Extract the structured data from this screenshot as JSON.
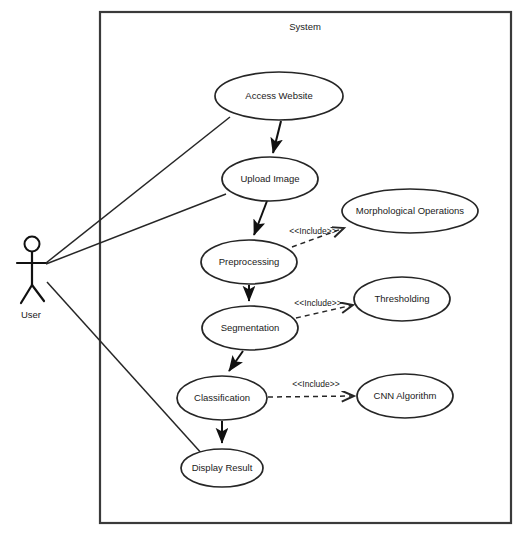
{
  "diagram": {
    "kind": "uml-use-case-diagram",
    "boundary": {
      "label": "System",
      "x": 100,
      "y": 12,
      "width": 411,
      "height": 511
    },
    "actors": [
      {
        "id": "user",
        "label": "User",
        "x": 32,
        "y": 244
      }
    ],
    "use_cases": [
      {
        "id": "access_website",
        "label": "Access Website",
        "cx": 279,
        "cy": 96,
        "rx": 64,
        "ry": 24
      },
      {
        "id": "upload_image",
        "label": "Upload Image",
        "cx": 270,
        "cy": 179,
        "rx": 48,
        "ry": 22
      },
      {
        "id": "preprocessing",
        "label": "Preprocessing",
        "cx": 249,
        "cy": 262,
        "rx": 48,
        "ry": 22
      },
      {
        "id": "segmentation",
        "label": "Segmentation",
        "cx": 250,
        "cy": 328,
        "rx": 48,
        "ry": 22
      },
      {
        "id": "classification",
        "label": "Classification",
        "cx": 222,
        "cy": 398,
        "rx": 45,
        "ry": 22
      },
      {
        "id": "display_result",
        "label": "Display Result",
        "cx": 222,
        "cy": 468,
        "rx": 41,
        "ry": 19
      },
      {
        "id": "morphological_operations",
        "label": "Morphological Operations",
        "cx": 410,
        "cy": 211,
        "rx": 68,
        "ry": 22
      },
      {
        "id": "thresholding",
        "label": "Thresholding",
        "cx": 402,
        "cy": 299,
        "rx": 48,
        "ry": 22
      },
      {
        "id": "cnn_algorithm",
        "label": "CNN Algorithm",
        "cx": 405,
        "cy": 396,
        "rx": 48,
        "ry": 22
      }
    ],
    "associations": [
      {
        "id": "user-access-website",
        "from": "user",
        "to": "access_website"
      },
      {
        "id": "user-upload-image",
        "from": "user",
        "to": "upload_image"
      },
      {
        "id": "user-display-result",
        "from": "user",
        "to": "display_result"
      }
    ],
    "flows": [
      {
        "id": "access-website-to-upload-image",
        "from": "access_website",
        "to": "upload_image"
      },
      {
        "id": "upload-image-to-preprocessing",
        "from": "upload_image",
        "to": "preprocessing"
      },
      {
        "id": "preprocessing-to-segmentation",
        "from": "preprocessing",
        "to": "segmentation"
      },
      {
        "id": "segmentation-to-classification",
        "from": "segmentation",
        "to": "classification"
      },
      {
        "id": "classification-to-display-result",
        "from": "classification",
        "to": "display_result"
      }
    ],
    "includes": [
      {
        "id": "preprocessing-includes-morphological",
        "from": "preprocessing",
        "to": "morphological_operations",
        "label": "<<Include>>"
      },
      {
        "id": "segmentation-includes-thresholding",
        "from": "segmentation",
        "to": "thresholding",
        "label": "<<Include>>"
      },
      {
        "id": "classification-includes-cnn",
        "from": "classification",
        "to": "cnn_algorithm",
        "label": "<<Include>>"
      }
    ],
    "colors": {
      "background": "#ffffff",
      "stroke": "#262626",
      "boundary_stroke": "#3a3a3a",
      "text": "#1a1a1a"
    }
  }
}
